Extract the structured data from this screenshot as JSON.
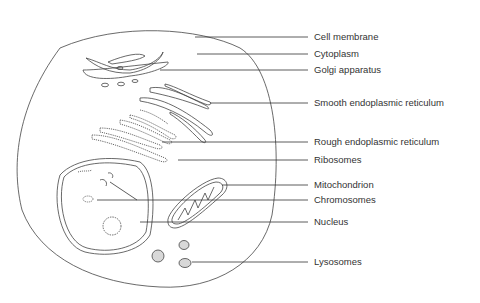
{
  "diagram": {
    "labels": [
      {
        "id": "cell-membrane",
        "text": "Cell membrane",
        "y": 37
      },
      {
        "id": "cytoplasm",
        "text": "Cytoplasm",
        "y": 54
      },
      {
        "id": "golgi-apparatus",
        "text": "Golgi apparatus",
        "y": 70
      },
      {
        "id": "smooth-er",
        "text": "Smooth endoplasmic reticulum",
        "y": 103
      },
      {
        "id": "rough-er",
        "text": "Rough endoplasmic reticulum",
        "y": 142
      },
      {
        "id": "ribosomes",
        "text": "Ribosomes",
        "y": 160
      },
      {
        "id": "mitochondrion",
        "text": "Mitochondrion",
        "y": 185
      },
      {
        "id": "chromosomes",
        "text": "Chromosomes",
        "y": 200
      },
      {
        "id": "nucleus",
        "text": "Nucleus",
        "y": 222
      },
      {
        "id": "lysosomes",
        "text": "Lysosomes",
        "y": 262
      }
    ],
    "colors": {
      "stroke": "#333333",
      "text": "#333333",
      "background": "#ffffff"
    }
  }
}
